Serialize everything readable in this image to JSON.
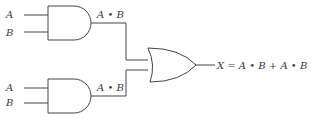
{
  "diagram": {
    "type": "logic-circuit",
    "colors": {
      "stroke": "#444444",
      "text": "#3a3a3a",
      "background": "#ffffff"
    },
    "gates": [
      {
        "id": "and1",
        "kind": "AND",
        "inputs": [
          "A",
          "B"
        ],
        "output_label": "A • B"
      },
      {
        "id": "and2",
        "kind": "AND",
        "inputs": [
          "A",
          "B"
        ],
        "output_label": "A • B"
      },
      {
        "id": "or1",
        "kind": "OR",
        "inputs": [
          "and1",
          "and2"
        ],
        "output_label": "X = A • B + A • B"
      }
    ]
  }
}
